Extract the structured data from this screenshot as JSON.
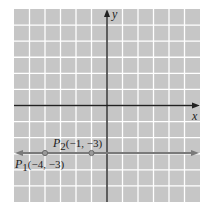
{
  "diagram": {
    "type": "coordinate-plane",
    "grid": {
      "x_range": [
        -6,
        6
      ],
      "y_range": [
        -6,
        6
      ],
      "cell_color": "#c6c6c6",
      "line_color": "#ffffff"
    },
    "axes": {
      "x_label": "x",
      "y_label": "y",
      "color": "#222222"
    },
    "line": {
      "description": "horizontal line y = -3",
      "y": -3,
      "color": "#7a7a7a"
    },
    "points": [
      {
        "name": "P1",
        "sub": "1",
        "x": -4,
        "y": -3,
        "label": "P",
        "coords": "(−4, −3)"
      },
      {
        "name": "P2",
        "sub": "2",
        "x": -1,
        "y": -3,
        "label": "P",
        "coords": "(−1, −3)"
      }
    ]
  }
}
